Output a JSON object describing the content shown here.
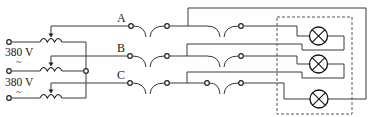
{
  "diagram": {
    "type": "three-phase circuit schematic",
    "sources": [
      {
        "voltage_label": "380 V",
        "ac_symbol": "~"
      },
      {
        "voltage_label": "380 V",
        "ac_symbol": "~"
      }
    ],
    "phases": [
      {
        "label": "A"
      },
      {
        "label": "B"
      },
      {
        "label": "C"
      }
    ],
    "components": {
      "autotransformer_coils": 3,
      "fuse_switch_pairs_per_line": 2,
      "lamps": 3,
      "load_enclosure": "dashed box"
    },
    "colors": {
      "wire": "#3a3a3a",
      "background": "#ffffff"
    }
  }
}
